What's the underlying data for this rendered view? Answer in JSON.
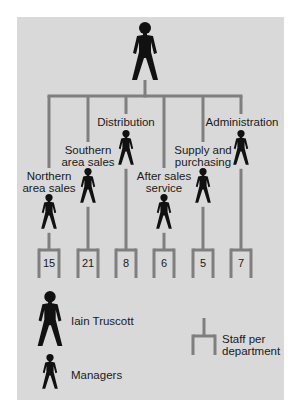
{
  "diagram": {
    "type": "org-chart",
    "head": {
      "name": "Iain Truscott",
      "icon": "person-large-icon"
    },
    "departments": [
      {
        "label_lines": [
          "Northern",
          "area sales"
        ],
        "staff": "15"
      },
      {
        "label_lines": [
          "Southern",
          "area sales"
        ],
        "staff": "21"
      },
      {
        "label_lines": [
          "Distribution"
        ],
        "staff": "8"
      },
      {
        "label_lines": [
          "After sales",
          "service"
        ],
        "staff": "6"
      },
      {
        "label_lines": [
          "Supply and",
          "purchasing"
        ],
        "staff": "5"
      },
      {
        "label_lines": [
          "Administration"
        ],
        "staff": "7"
      }
    ],
    "legend": {
      "head_label": "Iain Truscott",
      "managers_label": "Managers",
      "staff_label_lines": [
        "Staff per",
        "department"
      ]
    },
    "colors": {
      "background": "#d9d9d9",
      "connector": "#7f7f7f",
      "figure": "#111111",
      "text": "#1a1a1a"
    }
  }
}
